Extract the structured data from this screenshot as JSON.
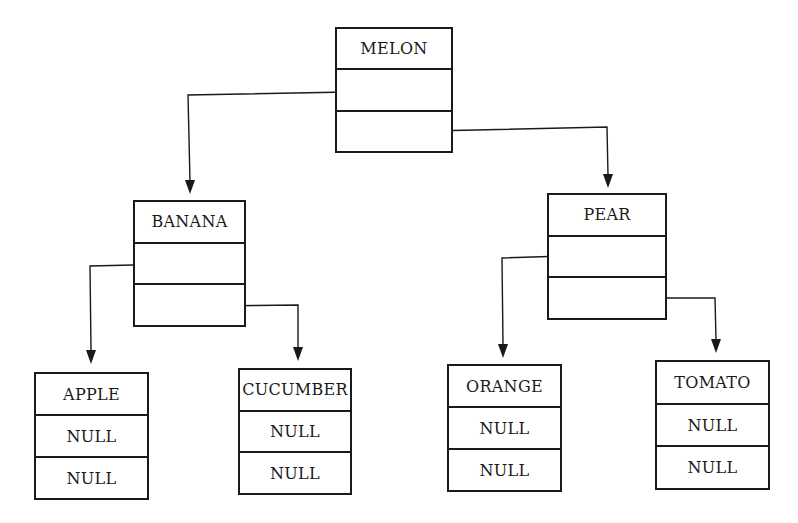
{
  "diagram": {
    "type": "binary-search-tree",
    "nodes": [
      {
        "id": "melon",
        "label": "MELON",
        "left": "",
        "right": "",
        "box": [
          335,
          27,
          118,
          126
        ]
      },
      {
        "id": "banana",
        "label": "BANANA",
        "left": "",
        "right": "",
        "box": [
          133,
          200,
          113,
          127
        ]
      },
      {
        "id": "pear",
        "label": "PEAR",
        "left": "",
        "right": "",
        "box": [
          547,
          193,
          120,
          127
        ]
      },
      {
        "id": "apple",
        "label": "APPLE",
        "left": "NULL",
        "right": "NULL",
        "box": [
          34,
          372,
          115,
          128
        ]
      },
      {
        "id": "cucumber",
        "label": "CUCUMBER",
        "left": "NULL",
        "right": "NULL",
        "box": [
          238,
          368,
          114,
          127
        ]
      },
      {
        "id": "orange",
        "label": "ORANGE",
        "left": "NULL",
        "right": "NULL",
        "box": [
          447,
          364,
          115,
          128
        ]
      },
      {
        "id": "tomato",
        "label": "TOMATO",
        "left": "NULL",
        "right": "NULL",
        "box": [
          655,
          360,
          115,
          130
        ]
      }
    ],
    "edges": [
      {
        "from": "melon",
        "side": "left",
        "to": "banana"
      },
      {
        "from": "melon",
        "side": "right",
        "to": "pear"
      },
      {
        "from": "banana",
        "side": "left",
        "to": "apple"
      },
      {
        "from": "banana",
        "side": "right",
        "to": "cucumber"
      },
      {
        "from": "pear",
        "side": "left",
        "to": "orange"
      },
      {
        "from": "pear",
        "side": "right",
        "to": "tomato"
      }
    ],
    "line_color": "#1a1a1a"
  }
}
